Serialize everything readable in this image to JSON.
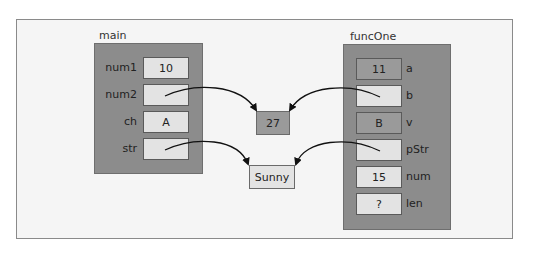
{
  "diagram": {
    "main": {
      "title": "main",
      "vars": [
        {
          "name": "num1",
          "value": "10"
        },
        {
          "name": "num2",
          "value": ""
        },
        {
          "name": "ch",
          "value": "A"
        },
        {
          "name": "str",
          "value": ""
        }
      ]
    },
    "funcOne": {
      "title": "funcOne",
      "vars": [
        {
          "name": "a",
          "value": "11"
        },
        {
          "name": "b",
          "value": ""
        },
        {
          "name": "v",
          "value": "B"
        },
        {
          "name": "pStr",
          "value": ""
        },
        {
          "name": "num",
          "value": "15"
        },
        {
          "name": "len",
          "value": "?"
        }
      ]
    },
    "heap": {
      "int_value": "27",
      "string_value": "Sunny"
    },
    "arrows": [
      {
        "from": "main.num2",
        "to": "heap.int_value"
      },
      {
        "from": "main.str",
        "to": "heap.string_value"
      },
      {
        "from": "funcOne.b",
        "to": "heap.int_value"
      },
      {
        "from": "funcOne.pStr",
        "to": "heap.string_value"
      }
    ],
    "colors": {
      "stack_bg": "#8c8c8c",
      "cell_light": "#e3e3e3",
      "cell_dark": "#9a9a9a",
      "frame_bg": "#f5f5f5"
    }
  }
}
